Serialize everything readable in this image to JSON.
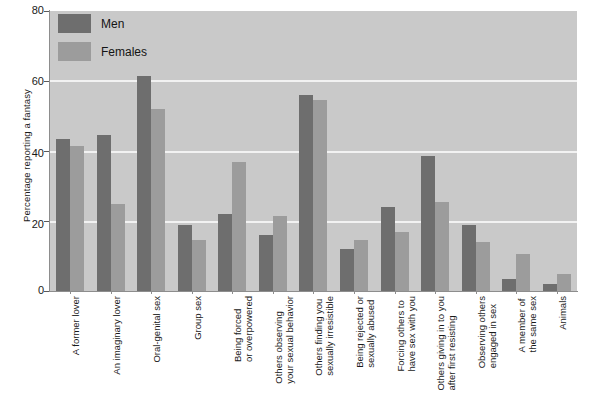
{
  "chart_data": {
    "type": "bar",
    "title": "",
    "xlabel": "",
    "ylabel": "Percentage reporting a fantasy",
    "ylim": [
      0,
      80
    ],
    "yticks": [
      0,
      20,
      40,
      60,
      80
    ],
    "grid": true,
    "legend_position": "top-left",
    "categories": [
      "A former lover",
      "An imaginary lover",
      "Oral-genital sex",
      "Group sex",
      "Being forced or overpowered",
      "Others observing your sexual behavior",
      "Others finding you sexually irresistible",
      "Being rejected or sexually abused",
      "Forcing others to have sex with you",
      "Others giving in to you after first resisting",
      "Observing others engaged in sex",
      "A member of the same sex",
      "Animals"
    ],
    "category_lines": [
      [
        "A former lover",
        ""
      ],
      [
        "An imaginary lover",
        ""
      ],
      [
        "Oral-genital sex",
        ""
      ],
      [
        "Group sex",
        ""
      ],
      [
        "Being forced",
        "or overpowered"
      ],
      [
        "Others observing",
        "your sexual behavior"
      ],
      [
        "Others finding you",
        "sexually irresistible"
      ],
      [
        "Being rejected or",
        "sexually abused"
      ],
      [
        "Forcing others to",
        "have sex with you"
      ],
      [
        "Others giving in to you",
        "after first resisting"
      ],
      [
        "Observing others",
        "engaged in sex"
      ],
      [
        "A member of",
        "the same sex"
      ],
      [
        "Animals",
        ""
      ]
    ],
    "series": [
      {
        "name": "Men",
        "color": "#6e6e6e",
        "values": [
          43.5,
          44.5,
          61.5,
          19,
          22,
          16,
          56,
          12,
          24,
          38.5,
          19,
          3.5,
          2
        ]
      },
      {
        "name": "Females",
        "color": "#9c9c9c",
        "values": [
          41.5,
          25,
          52,
          14.5,
          37,
          21.5,
          54.5,
          14.5,
          17,
          25.5,
          14,
          10.5,
          5
        ]
      }
    ]
  },
  "legend": {
    "items": [
      {
        "label": "Men",
        "color": "#6e6e6e"
      },
      {
        "label": "Females",
        "color": "#9c9c9c"
      }
    ]
  },
  "axes": {
    "y_title": "Percentage reporting a fantasy",
    "y_tick_labels": [
      "80",
      "60",
      "40",
      "20",
      "0"
    ]
  },
  "colors": {
    "plot_background": "#c9c9c9",
    "page_background": "#ffffff",
    "gridline": "#f2f2f2",
    "axis_line": "#8d8d8d",
    "men": "#6e6e6e",
    "females": "#9c9c9c",
    "text": "#1a1a1a"
  }
}
